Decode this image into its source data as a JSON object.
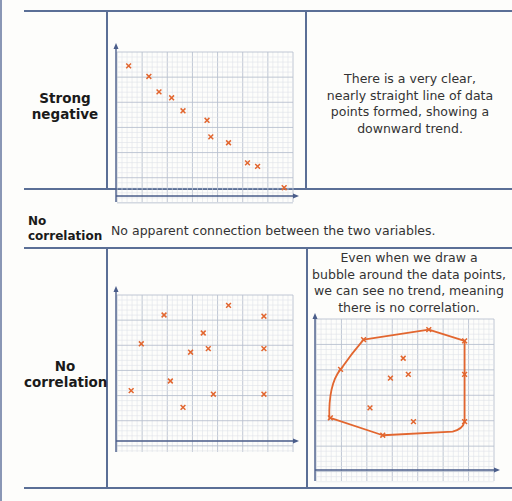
{
  "rows": [
    {
      "label": "Strong negative",
      "label_lines": [
        "Strong",
        "negative"
      ],
      "description_lines": [
        "There is a very clear,",
        "nearly straight line of data",
        "points formed, showing a",
        "downward trend."
      ]
    },
    {
      "label": "No correlation",
      "label_lines": [
        "No",
        "correlation"
      ],
      "description_lines": [
        "Even when we draw a",
        "bubble around the data points,",
        "we can see no trend, meaning",
        "there is no correlation."
      ]
    }
  ],
  "section": {
    "label_lines": [
      "No",
      "correlation"
    ],
    "definition": "No apparent connection between the two variables."
  },
  "colors": {
    "rule": "#5b6f96",
    "axis": "#4a5d8a",
    "grid_minor": "#dfe3ea",
    "grid_major": "#b9c1cf",
    "marker": "#e2662f",
    "bubble": "#e2662f"
  },
  "chart_data": [
    {
      "type": "scatter",
      "title": "Strong negative",
      "xlabel": "",
      "ylabel": "",
      "xlim": [
        0,
        14
      ],
      "ylim": [
        0,
        12
      ],
      "grid": true,
      "marker": "x",
      "points": [
        [
          1.0,
          11.0
        ],
        [
          2.6,
          10.1
        ],
        [
          3.4,
          8.8
        ],
        [
          4.4,
          8.3
        ],
        [
          5.3,
          7.2
        ],
        [
          7.2,
          6.4
        ],
        [
          7.5,
          5.0
        ],
        [
          8.9,
          4.5
        ],
        [
          10.4,
          2.8
        ],
        [
          11.2,
          2.5
        ],
        [
          13.3,
          0.7
        ]
      ]
    },
    {
      "type": "scatter",
      "title": "No correlation",
      "xlabel": "",
      "ylabel": "",
      "xlim": [
        0,
        14
      ],
      "ylim": [
        0,
        12
      ],
      "grid": true,
      "marker": "x",
      "points": [
        [
          1.2,
          4.2
        ],
        [
          2.0,
          8.1
        ],
        [
          3.8,
          10.5
        ],
        [
          4.3,
          5.0
        ],
        [
          5.3,
          2.8
        ],
        [
          5.9,
          7.4
        ],
        [
          6.9,
          9.0
        ],
        [
          7.3,
          7.7
        ],
        [
          7.7,
          3.9
        ],
        [
          8.9,
          11.3
        ],
        [
          11.7,
          10.4
        ],
        [
          11.7,
          7.7
        ],
        [
          11.7,
          3.9
        ]
      ]
    },
    {
      "type": "scatter",
      "title": "No correlation (with bubble)",
      "xlabel": "",
      "ylabel": "",
      "xlim": [
        0,
        14
      ],
      "ylim": [
        0,
        12
      ],
      "grid": true,
      "marker": "x",
      "points": [
        [
          1.2,
          4.2
        ],
        [
          2.0,
          8.1
        ],
        [
          3.8,
          10.5
        ],
        [
          4.3,
          5.0
        ],
        [
          5.3,
          2.8
        ],
        [
          5.9,
          7.4
        ],
        [
          6.9,
          9.0
        ],
        [
          7.3,
          7.7
        ],
        [
          7.7,
          3.9
        ],
        [
          8.9,
          11.3
        ],
        [
          11.7,
          10.4
        ],
        [
          11.7,
          7.7
        ],
        [
          11.7,
          3.9
        ]
      ],
      "annotation": "bubble enclosing all points"
    }
  ]
}
